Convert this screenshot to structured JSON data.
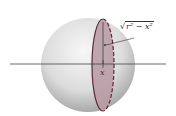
{
  "figure": {
    "labels": {
      "x": "x",
      "radius_expr_prefix": "√",
      "radius_expr_body": "r² − x²"
    },
    "colors": {
      "sphere_light": "#f4f4f4",
      "sphere_dark": "#a8a8a8",
      "cross_section_fill": "#b79aa3",
      "cross_section_edge": "#5a2a35",
      "axis": "#444444"
    }
  }
}
